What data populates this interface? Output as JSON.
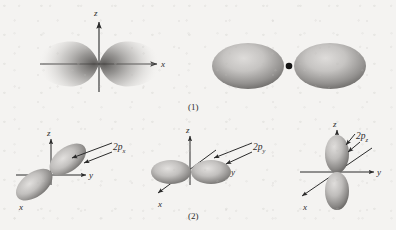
{
  "figure": {
    "background_color": "#f4f3f1",
    "ink_color": "#2b2b2b",
    "lobe_color_light": "#d8d6d4",
    "lobe_color_dark": "#6f6d6b",
    "nucleus_color": "#141414"
  },
  "panels": [
    {
      "id": "panel-1",
      "caption": "(1)",
      "subpanels": [
        {
          "id": "electron-density-cloud",
          "style": "dot-density",
          "axes": [
            {
              "name": "z",
              "label": "z",
              "direction": "up",
              "arrow": true
            },
            {
              "name": "x",
              "label": "x",
              "direction": "right",
              "arrow": true
            }
          ],
          "lobes": 2,
          "lobe_axis": "x",
          "description": "electron probability density cloud of a 2p orbital, two lobes along x"
        },
        {
          "id": "boundary-surface",
          "style": "boundary-surface",
          "axes": [],
          "lobes": 2,
          "lobe_axis": "horizontal",
          "nucleus": true,
          "description": "boundary surface dumbbell representation with nucleus dot"
        }
      ]
    },
    {
      "id": "panel-2",
      "caption": "(2)",
      "subpanels": [
        {
          "id": "orbital-2px",
          "label": "2p",
          "label_sub": "x",
          "lobe_axis": "x",
          "axes": [
            {
              "name": "z",
              "label": "z",
              "direction": "up",
              "arrow": true
            },
            {
              "name": "y",
              "label": "y",
              "direction": "right",
              "arrow": true
            },
            {
              "name": "x",
              "label": "x",
              "direction": "down-left",
              "arrow": true
            }
          ]
        },
        {
          "id": "orbital-2py",
          "label": "2p",
          "label_sub": "y",
          "lobe_axis": "y",
          "axes": [
            {
              "name": "z",
              "label": "z",
              "direction": "up",
              "arrow": true
            },
            {
              "name": "y",
              "label": "y",
              "direction": "right",
              "arrow": true
            },
            {
              "name": "x",
              "label": "x",
              "direction": "down-left",
              "arrow": true
            }
          ]
        },
        {
          "id": "orbital-2pz",
          "label": "2p",
          "label_sub": "z",
          "lobe_axis": "z",
          "axes": [
            {
              "name": "z",
              "label": "z",
              "direction": "up",
              "arrow": true
            },
            {
              "name": "y",
              "label": "y",
              "direction": "right",
              "arrow": true
            },
            {
              "name": "x",
              "label": "x",
              "direction": "down-left",
              "arrow": true
            }
          ]
        }
      ]
    }
  ]
}
